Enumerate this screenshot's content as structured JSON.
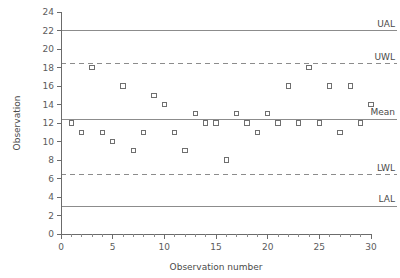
{
  "chart_data": {
    "type": "scatter",
    "title": "",
    "xlabel": "Observation number",
    "ylabel": "Observation",
    "xlim": [
      0,
      30
    ],
    "ylim": [
      0,
      24
    ],
    "xticks": [
      0,
      5,
      10,
      15,
      20,
      25,
      30
    ],
    "yticks": [
      0,
      2,
      4,
      6,
      8,
      10,
      12,
      14,
      16,
      18,
      20,
      22,
      24
    ],
    "xtick_labels": [
      "0",
      "5",
      "10",
      "15",
      "20",
      "25",
      "30"
    ],
    "ytick_labels": [
      "0",
      "2",
      "4",
      "6",
      "8",
      "10",
      "12",
      "14",
      "16",
      "18",
      "20",
      "22",
      "24"
    ],
    "x_minor_tick_interval": 1,
    "grid": false,
    "legend_position": "none",
    "marker": "open-square",
    "x": [
      1,
      2,
      3,
      4,
      5,
      6,
      7,
      8,
      9,
      10,
      11,
      12,
      13,
      14,
      15,
      16,
      17,
      18,
      19,
      20,
      21,
      22,
      23,
      24,
      25,
      26,
      27,
      28,
      29,
      30
    ],
    "y": [
      12,
      11,
      18,
      11,
      10,
      16,
      9,
      11,
      15,
      14,
      11,
      9,
      13,
      12,
      12,
      8,
      13,
      12,
      11,
      13,
      12,
      16,
      12,
      18,
      12,
      16,
      11,
      16,
      12,
      14
    ],
    "control_lines": [
      {
        "name": "UAL",
        "label": "UAL",
        "value": 22,
        "style": "solid"
      },
      {
        "name": "UWL",
        "label": "UWL",
        "value": 18.4,
        "style": "dashed"
      },
      {
        "name": "Mean",
        "label": "Mean",
        "value": 12.4,
        "style": "solid"
      },
      {
        "name": "LWL",
        "label": "LWL",
        "value": 6.4,
        "style": "dashed"
      },
      {
        "name": "LAL",
        "label": "LAL",
        "value": 3,
        "style": "solid"
      }
    ],
    "colors": {
      "axis": "#6b6b6b",
      "marker": "#6f6f6f",
      "limit_line": "#8c8c8c",
      "text": "#4a4a4a",
      "background": "#ffffff"
    }
  }
}
